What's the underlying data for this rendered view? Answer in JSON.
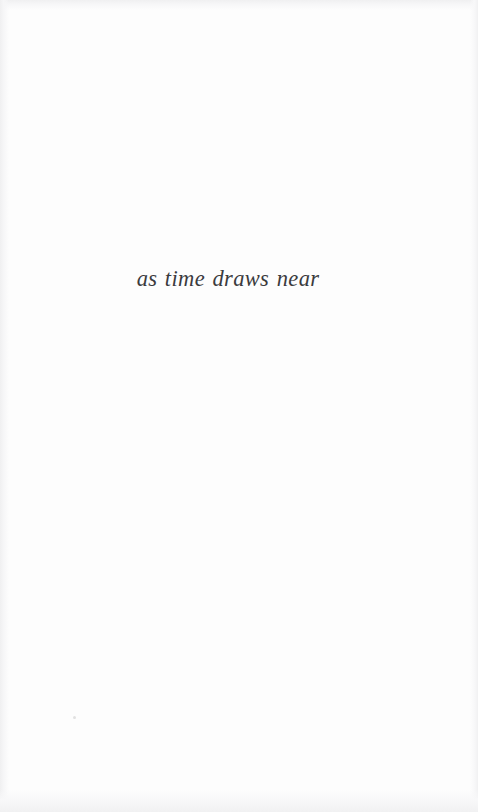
{
  "page": {
    "kind": "scanned-book-page",
    "background_color": "#fdfdfd",
    "width": 478,
    "height": 812
  },
  "content": {
    "epigraph": "as time draws near"
  },
  "typography": {
    "text_color": "#3b3b3d",
    "style": "italic-serif"
  },
  "artifacts": {
    "speck_color": "#dcdcdc",
    "edge_shade_color": "#f0f0f1"
  }
}
